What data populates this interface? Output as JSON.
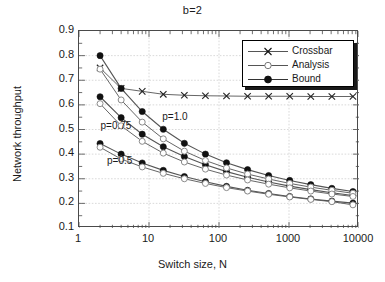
{
  "chart_data": {
    "type": "line",
    "title": "b=2",
    "xlabel": "Switch size, N",
    "ylabel": "Network throughput",
    "xscale": "log",
    "xlim": [
      1,
      10000
    ],
    "ylim": [
      0.1,
      0.9
    ],
    "xticks": [
      1,
      10,
      100,
      1000,
      10000
    ],
    "xtick_labels": [
      "1",
      "10",
      "100",
      "1000",
      "10000"
    ],
    "yticks": [
      0.1,
      0.2,
      0.3,
      0.4,
      0.5,
      0.6,
      0.7,
      0.8,
      0.9
    ],
    "ytick_labels": [
      "0.1",
      "0.2",
      "0.3",
      "0.4",
      "0.5",
      "0.6",
      "0.7",
      "0.8",
      "0.9"
    ],
    "grid": true,
    "legend_position": "upper right",
    "legend": [
      "Crossbar",
      "Analysis",
      "Bound"
    ],
    "annotations": [
      {
        "text": "p=1.0",
        "x": 16,
        "y": 0.545
      },
      {
        "text": "p=0.75",
        "x": 2.1,
        "y": 0.512
      },
      {
        "text": "p=0.5",
        "x": 2.6,
        "y": 0.368
      }
    ],
    "x": [
      2,
      4,
      8,
      16,
      32,
      64,
      128,
      256,
      512,
      1024,
      2048,
      4096,
      8192
    ],
    "series": [
      {
        "name": "Crossbar",
        "marker": "x",
        "p": 1.0,
        "values": [
          0.75,
          0.667,
          0.655,
          0.643,
          0.639,
          0.637,
          0.636,
          0.635,
          0.635,
          0.635,
          0.634,
          0.634,
          0.634
        ]
      },
      {
        "name": "Bound",
        "marker": "filled-circle",
        "p": 1.0,
        "values": [
          0.8,
          0.667,
          0.573,
          0.501,
          0.444,
          0.4,
          0.365,
          0.337,
          0.313,
          0.293,
          0.276,
          0.261,
          0.248
        ]
      },
      {
        "name": "Bound",
        "marker": "filled-circle",
        "p": 0.75,
        "values": [
          0.633,
          0.548,
          0.481,
          0.43,
          0.39,
          0.357,
          0.329,
          0.306,
          0.287,
          0.27,
          0.256,
          0.243,
          0.232
        ]
      },
      {
        "name": "Bound",
        "marker": "filled-circle",
        "p": 0.5,
        "values": [
          0.443,
          0.4,
          0.364,
          0.334,
          0.309,
          0.288,
          0.269,
          0.253,
          0.24,
          0.228,
          0.218,
          0.209,
          0.201
        ]
      },
      {
        "name": "Analysis",
        "marker": "open-circle",
        "p": 1.0,
        "values": [
          0.745,
          0.62,
          0.53,
          0.462,
          0.412,
          0.374,
          0.344,
          0.319,
          0.299,
          0.281,
          0.266,
          0.253,
          0.241
        ]
      },
      {
        "name": "Analysis",
        "marker": "open-circle",
        "p": 0.75,
        "values": [
          0.605,
          0.515,
          0.452,
          0.404,
          0.368,
          0.339,
          0.315,
          0.295,
          0.278,
          0.263,
          0.25,
          0.238,
          0.228
        ]
      },
      {
        "name": "Analysis",
        "marker": "open-circle",
        "p": 0.5,
        "values": [
          0.428,
          0.38,
          0.348,
          0.322,
          0.3,
          0.281,
          0.264,
          0.25,
          0.237,
          0.226,
          0.216,
          0.207,
          0.194
        ]
      }
    ],
    "colors": {
      "line": "#555555",
      "marker_fill": "#111111",
      "axis": "#4a4a4a",
      "grid": "#c8c8c8",
      "text": "#1a1a1a"
    }
  }
}
